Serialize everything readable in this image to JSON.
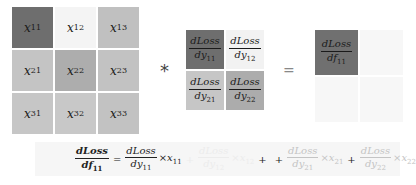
{
  "input_matrix": {
    "cells": [
      {
        "var": "x",
        "sub": "11",
        "color": "#6e6e6e"
      },
      {
        "var": "x",
        "sub": "12",
        "color": "#f4f4f4"
      },
      {
        "var": "x",
        "sub": "13",
        "color": "#c0c0c0"
      },
      {
        "var": "x",
        "sub": "21",
        "color": "#c4c4c4"
      },
      {
        "var": "x",
        "sub": "22",
        "color": "#adadad"
      },
      {
        "var": "x",
        "sub": "23",
        "color": "#c2c2c2"
      },
      {
        "var": "x",
        "sub": "31",
        "color": "#c6c6c6"
      },
      {
        "var": "x",
        "sub": "32",
        "color": "#c8c8c8"
      },
      {
        "var": "x",
        "sub": "33",
        "color": "#c2c2c2"
      }
    ]
  },
  "operator_conv": "*",
  "kernel_matrix": {
    "cells": [
      {
        "num": "dLoss",
        "den": "dy",
        "sub": "11",
        "color": "#6e6e6e"
      },
      {
        "num": "dLoss",
        "den": "dy",
        "sub": "12",
        "color": "#f2f2f2"
      },
      {
        "num": "dLoss",
        "den": "dy",
        "sub": "21",
        "color": "#c6c6c6"
      },
      {
        "num": "dLoss",
        "den": "dy",
        "sub": "22",
        "color": "#acacac"
      }
    ]
  },
  "operator_equals": "=",
  "output_matrix": {
    "cells": [
      {
        "num": "dLoss",
        "den": "df",
        "sub": "11",
        "color": "#707070",
        "visible": true
      },
      {
        "color": "#f7f7f7",
        "visible": false
      },
      {
        "color": "#f7f7f7",
        "visible": false
      },
      {
        "color": "#f7f7f7",
        "visible": false
      }
    ]
  },
  "formula": {
    "lhs": {
      "num": "dLoss",
      "den": "df",
      "sub": "11"
    },
    "equals": "=",
    "terms": [
      {
        "num": "dLoss",
        "den": "dy",
        "dsub": "11",
        "times": "×",
        "x": "x",
        "xsub": "11",
        "style": "normal"
      },
      {
        "num": "dLoss",
        "den": "dy",
        "dsub": "12",
        "times": "×",
        "x": "x",
        "xsub": "12",
        "style": "hidden"
      },
      {
        "num": "dLoss",
        "den": "dy",
        "dsub": "21",
        "times": "×",
        "x": "x",
        "xsub": "21",
        "style": "faint"
      },
      {
        "num": "dLoss",
        "den": "dy",
        "dsub": "22",
        "times": "×",
        "x": "x",
        "xsub": "22",
        "style": "faint"
      }
    ],
    "plus": "+"
  }
}
